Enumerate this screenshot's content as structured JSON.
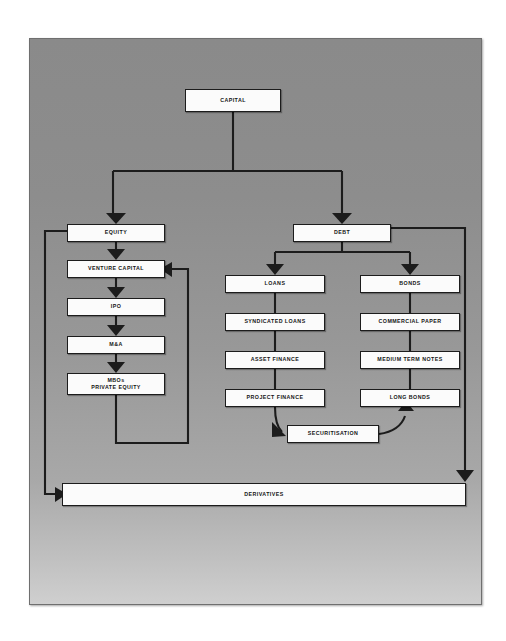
{
  "diagram": {
    "background_color": "#8a8a8a",
    "node_fill": "#fbfbfb",
    "node_stroke": "#1c1c1c",
    "nodes": [
      {
        "id": "capital",
        "label": "CAPITAL",
        "x": 185,
        "y": 89,
        "w": 96,
        "h": 23
      },
      {
        "id": "equity",
        "label": "EQUITY",
        "x": 67,
        "y": 224,
        "w": 98,
        "h": 18
      },
      {
        "id": "debt",
        "label": "DEBT",
        "x": 293,
        "y": 224,
        "w": 98,
        "h": 18
      },
      {
        "id": "venture-capital",
        "label": "VENTURE CAPITAL",
        "x": 67,
        "y": 260,
        "w": 98,
        "h": 18
      },
      {
        "id": "ipo",
        "label": "IPO",
        "x": 67,
        "y": 298,
        "w": 98,
        "h": 18
      },
      {
        "id": "m-and-a",
        "label": "M&A",
        "x": 67,
        "y": 336,
        "w": 98,
        "h": 18
      },
      {
        "id": "mbos",
        "label": "MBOs\nPRIVATE EQUITY",
        "x": 67,
        "y": 373,
        "w": 98,
        "h": 22
      },
      {
        "id": "loans",
        "label": "LOANS",
        "x": 225,
        "y": 275,
        "w": 100,
        "h": 18
      },
      {
        "id": "syndicated-loans",
        "label": "SYNDICATED LOANS",
        "x": 225,
        "y": 313,
        "w": 100,
        "h": 18
      },
      {
        "id": "asset-finance",
        "label": "ASSET FINANCE",
        "x": 225,
        "y": 351,
        "w": 100,
        "h": 18
      },
      {
        "id": "project-finance",
        "label": "PROJECT FINANCE",
        "x": 225,
        "y": 389,
        "w": 100,
        "h": 18
      },
      {
        "id": "bonds",
        "label": "BONDS",
        "x": 360,
        "y": 275,
        "w": 100,
        "h": 18
      },
      {
        "id": "commercial-paper",
        "label": "COMMERCIAL PAPER",
        "x": 360,
        "y": 313,
        "w": 100,
        "h": 18
      },
      {
        "id": "medium-term-notes",
        "label": "MEDIUM TERM NOTES",
        "x": 360,
        "y": 351,
        "w": 100,
        "h": 18
      },
      {
        "id": "long-bonds",
        "label": "LONG BONDS",
        "x": 360,
        "y": 389,
        "w": 100,
        "h": 18
      },
      {
        "id": "securitisation",
        "label": "SECURITISATION",
        "x": 287,
        "y": 425,
        "w": 92,
        "h": 18
      },
      {
        "id": "derivatives",
        "label": "DERIVATIVES",
        "x": 62,
        "y": 483,
        "w": 404,
        "h": 23
      }
    ],
    "edges": [
      {
        "from": "capital",
        "to": "equity",
        "kind": "tree-branch-left"
      },
      {
        "from": "capital",
        "to": "debt",
        "kind": "tree-branch-right"
      },
      {
        "from": "equity",
        "to": "venture-capital",
        "kind": "down-arrow"
      },
      {
        "from": "venture-capital",
        "to": "ipo",
        "kind": "down-arrow"
      },
      {
        "from": "ipo",
        "to": "m-and-a",
        "kind": "down-arrow"
      },
      {
        "from": "m-and-a",
        "to": "mbos",
        "kind": "down-arrow"
      },
      {
        "from": "mbos",
        "to": "venture-capital",
        "kind": "feedback-loop-right"
      },
      {
        "from": "equity",
        "to": "derivatives",
        "kind": "feedback-loop-left"
      },
      {
        "from": "debt",
        "to": "loans",
        "kind": "tree-branch-left"
      },
      {
        "from": "debt",
        "to": "bonds",
        "kind": "tree-branch-right"
      },
      {
        "from": "loans",
        "to": "syndicated-loans",
        "kind": "plain-line"
      },
      {
        "from": "syndicated-loans",
        "to": "asset-finance",
        "kind": "plain-line"
      },
      {
        "from": "asset-finance",
        "to": "project-finance",
        "kind": "plain-line"
      },
      {
        "from": "project-finance",
        "to": "securitisation",
        "kind": "curved-arrow"
      },
      {
        "from": "securitisation",
        "to": "long-bonds",
        "kind": "curved-arrow"
      },
      {
        "from": "bonds",
        "to": "commercial-paper",
        "kind": "plain-line"
      },
      {
        "from": "commercial-paper",
        "to": "medium-term-notes",
        "kind": "plain-line"
      },
      {
        "from": "medium-term-notes",
        "to": "long-bonds",
        "kind": "plain-line"
      },
      {
        "from": "debt",
        "to": "derivatives",
        "kind": "feedback-loop-right"
      }
    ]
  }
}
